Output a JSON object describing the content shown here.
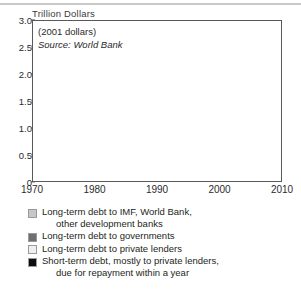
{
  "figure": {
    "y_axis_title": "Trillion Dollars",
    "annotation_line1": "(2001 dollars)",
    "annotation_line2": "Source: World Bank"
  },
  "legend": {
    "items": [
      {
        "color": "#c6c7c8",
        "label_line1": "Long-term debt to IMF, World Bank,",
        "label_line2": "other development banks"
      },
      {
        "color": "#6e6f71",
        "label_line1": "Long-term debt to governments",
        "label_line2": ""
      },
      {
        "color": "#efefef",
        "label_line1": "Long-term debt to private lenders",
        "label_line2": ""
      },
      {
        "color": "#0d0d0d",
        "label_line1": "Short-term debt, mostly to private lenders,",
        "label_line2": "due for repayment within a year"
      }
    ]
  },
  "chart_data": {
    "type": "area",
    "stacked": true,
    "title": "",
    "xlabel": "",
    "ylabel": "Trillion Dollars",
    "xlim": [
      1970,
      2010
    ],
    "ylim": [
      0,
      3.0
    ],
    "grid": false,
    "legend_position": "below",
    "xticks": [
      1970,
      1980,
      1990,
      2000,
      2010
    ],
    "xtick_labels": [
      "1970",
      "1980",
      "1990",
      "2000",
      "2010"
    ],
    "yticks": [
      0,
      0.5,
      1.0,
      1.5,
      2.0,
      2.5,
      3.0
    ],
    "ytick_labels": [
      "0",
      "0.5",
      "1.0",
      "1.5",
      "2.0",
      "2.5",
      "3.0"
    ],
    "x": [
      1970,
      1971,
      1972,
      1973,
      1974,
      1975,
      1976,
      1977,
      1978,
      1979,
      1980,
      1981,
      1982,
      1983,
      1984,
      1985,
      1986,
      1987,
      1988,
      1989,
      1990,
      1991,
      1992,
      1993,
      1994,
      1995,
      1996,
      1997,
      1998,
      1999,
      2000,
      2001
    ],
    "series": [
      {
        "name": "Short-term debt, mostly to private lenders, due for repayment within a year",
        "color": "#0d0d0d",
        "values": [
          0.03,
          0.03,
          0.04,
          0.05,
          0.06,
          0.07,
          0.09,
          0.11,
          0.14,
          0.17,
          0.22,
          0.27,
          0.3,
          0.26,
          0.24,
          0.23,
          0.22,
          0.22,
          0.23,
          0.24,
          0.26,
          0.28,
          0.31,
          0.34,
          0.38,
          0.42,
          0.47,
          0.5,
          0.48,
          0.46,
          0.44,
          0.38
        ]
      },
      {
        "name": "Long-term debt to private lenders",
        "color": "#efefef",
        "values": [
          0.05,
          0.06,
          0.08,
          0.11,
          0.15,
          0.2,
          0.26,
          0.33,
          0.41,
          0.48,
          0.55,
          0.6,
          0.63,
          0.66,
          0.68,
          0.7,
          0.69,
          0.68,
          0.66,
          0.65,
          0.66,
          0.68,
          0.71,
          0.76,
          0.82,
          0.88,
          0.94,
          1.02,
          1.12,
          1.21,
          1.25,
          1.16
        ]
      },
      {
        "name": "Long-term debt to governments",
        "color": "#6e6f71",
        "values": [
          0.09,
          0.1,
          0.11,
          0.12,
          0.14,
          0.16,
          0.19,
          0.22,
          0.25,
          0.27,
          0.29,
          0.3,
          0.32,
          0.34,
          0.36,
          0.4,
          0.44,
          0.48,
          0.47,
          0.45,
          0.44,
          0.44,
          0.45,
          0.46,
          0.48,
          0.5,
          0.51,
          0.52,
          0.54,
          0.56,
          0.56,
          0.53
        ]
      },
      {
        "name": "Long-term debt to IMF, World Bank, other development banks",
        "color": "#c6c7c8",
        "values": [
          0.03,
          0.03,
          0.04,
          0.05,
          0.06,
          0.07,
          0.08,
          0.1,
          0.12,
          0.14,
          0.16,
          0.18,
          0.2,
          0.22,
          0.25,
          0.28,
          0.31,
          0.34,
          0.33,
          0.32,
          0.33,
          0.34,
          0.35,
          0.36,
          0.37,
          0.38,
          0.38,
          0.38,
          0.4,
          0.44,
          0.42,
          0.38
        ]
      }
    ],
    "totals": [
      0.2,
      0.22,
      0.27,
      0.33,
      0.41,
      0.5,
      0.62,
      0.76,
      0.92,
      1.06,
      1.22,
      1.35,
      1.45,
      1.48,
      1.53,
      1.61,
      1.66,
      1.72,
      1.69,
      1.66,
      1.69,
      1.74,
      1.82,
      1.92,
      2.05,
      2.18,
      2.3,
      2.42,
      2.54,
      2.67,
      2.67,
      2.45
    ],
    "data_end_year": 2001
  }
}
